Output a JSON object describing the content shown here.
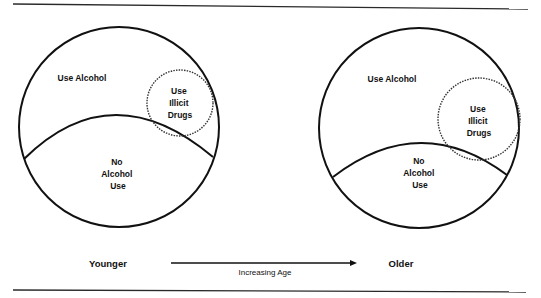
{
  "diagram": {
    "type": "venn-progression",
    "panels": [
      {
        "id": "younger",
        "outer_label": "Use Alcohol",
        "drug_label_lines": [
          "Use",
          "Illicit",
          "Drugs"
        ],
        "no_alcohol_label_lines": [
          "No",
          "Alcohol",
          "Use"
        ]
      },
      {
        "id": "older",
        "outer_label": "Use Alcohol",
        "drug_label_lines": [
          "Use",
          "Illicit",
          "Drugs"
        ],
        "no_alcohol_label_lines": [
          "No",
          "Alcohol",
          "Use"
        ]
      }
    ],
    "axis": {
      "start_label": "Younger",
      "end_label": "Older",
      "arrow_label": "Increasing Age"
    }
  }
}
